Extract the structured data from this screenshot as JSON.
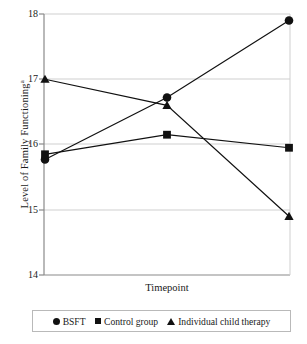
{
  "chart_data": {
    "type": "line",
    "title": "",
    "xlabel": "Timepoint",
    "ylabel": "Level of Family Functioning",
    "ylabel_superscript": "a",
    "categories": [
      "1",
      "2",
      "3"
    ],
    "x": [
      1,
      2,
      3
    ],
    "ylim": [
      14,
      18
    ],
    "yticks": [
      "14",
      "15",
      "16",
      "17",
      "18"
    ],
    "ytick_values": [
      14,
      15,
      16,
      17,
      18
    ],
    "xticks": [],
    "grid": "horizontal",
    "legend_position": "bottom",
    "series": [
      {
        "name": "BSFT",
        "marker": "circle",
        "color": "#111111",
        "values": [
          15.77,
          16.72,
          17.9
        ]
      },
      {
        "name": "Control group",
        "marker": "square",
        "color": "#111111",
        "values": [
          15.85,
          16.15,
          15.95
        ]
      },
      {
        "name": "Individual child therapy",
        "marker": "triangle",
        "color": "#111111",
        "values": [
          17.0,
          16.6,
          14.9
        ]
      }
    ]
  },
  "axis": {
    "ylabel_text": "Level of Family Functioning",
    "ylabel_sup": "a",
    "xlabel_text": "Timepoint",
    "tick_18": "18",
    "tick_17": "17",
    "tick_16": "16",
    "tick_15": "15",
    "tick_14": "14"
  },
  "legend": {
    "items": [
      {
        "label": "BSFT",
        "marker": "circle-marker"
      },
      {
        "label": "Control group",
        "marker": "square-marker"
      },
      {
        "label": "Individual child therapy",
        "marker": "triangle-marker"
      }
    ]
  },
  "style": {
    "grid_color": "#cfcfcf",
    "axis_color": "#8a8a8a",
    "series_color": "#111111",
    "legend_border": "#b9b9b9",
    "background": "#ffffff"
  }
}
